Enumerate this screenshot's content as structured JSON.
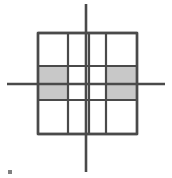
{
  "figure": {
    "title": "",
    "type": "geometric-grid-diagram",
    "canvas": {
      "width": 172,
      "height": 178,
      "background": "#ffffff"
    },
    "colors": {
      "grid_line": "#4a4a4a",
      "axis_line": "#4a4a4a",
      "shaded_cell": "#c8c8c8",
      "unshaded_cell": "#ffffff",
      "speck": "#808080"
    },
    "axes": {
      "vertical": {
        "x": 86,
        "y1": 4,
        "y2": 172,
        "width": 2.6
      },
      "horizontal": {
        "y": 84,
        "x1": 7,
        "x2": 165,
        "width": 2.6
      }
    },
    "grid": {
      "left": 38,
      "top": 33,
      "right": 137,
      "bottom": 134,
      "vertical_lines": [
        38,
        68,
        89,
        106,
        137
      ],
      "horizontal_lines": [
        33,
        66,
        100,
        134
      ],
      "line_width": 2.2,
      "border_width": 2.4
    },
    "shaded_regions": [
      {
        "name": "left-upper-middle",
        "x": 38,
        "y": 66,
        "w": 30,
        "h": 18
      },
      {
        "name": "left-lower-middle",
        "x": 38,
        "y": 84,
        "w": 30,
        "h": 16
      },
      {
        "name": "right-upper-middle",
        "x": 106,
        "y": 66,
        "w": 31,
        "h": 18
      },
      {
        "name": "right-lower-middle",
        "x": 106,
        "y": 84,
        "w": 31,
        "h": 16
      }
    ],
    "speck": {
      "x": 8,
      "y": 170,
      "w": 4,
      "h": 4
    }
  }
}
